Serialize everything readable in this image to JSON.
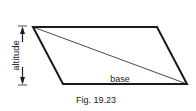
{
  "figure": {
    "caption": "Fig. 19.23",
    "shape": "parallelogram",
    "labels": {
      "altitude": "altitude",
      "base": "base"
    },
    "vertices": {
      "top_left": [
        33,
        27
      ],
      "top_right": [
        157,
        27
      ],
      "bottom_right": [
        187,
        84
      ],
      "bottom_left": [
        63,
        84
      ]
    },
    "diagonal": "top_left-to-bottom_right",
    "colors": {
      "stroke": "#1a1a1a",
      "background": "#ffffff"
    }
  }
}
